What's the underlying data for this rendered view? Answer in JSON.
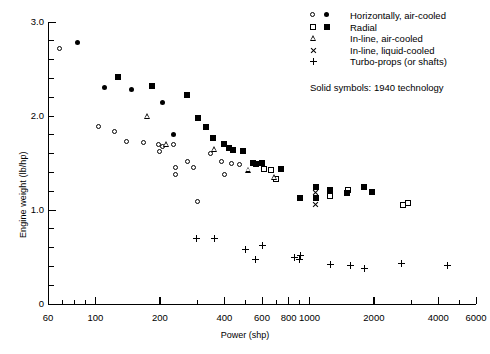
{
  "chart_data": {
    "type": "scatter",
    "title": "",
    "xlabel": "Power (shp)",
    "ylabel": "Engine weight (lb/hp)",
    "xscale": "log",
    "yscale": "linear",
    "xlim": [
      60,
      6000
    ],
    "ylim": [
      0,
      3.0
    ],
    "xticks": [
      60,
      100,
      200,
      400,
      600,
      800,
      1000,
      2000,
      4000,
      6000
    ],
    "xtick_labels": [
      "60",
      "100",
      "200",
      "400",
      "600",
      "800",
      "1000",
      "2000",
      "4000",
      "6000"
    ],
    "yticks": [
      0,
      1.0,
      2.0,
      3.0
    ],
    "ytick_labels": [
      "0",
      "1.0",
      "2.0",
      "3.0"
    ],
    "ytick_minor_step": 0.2,
    "grid": false,
    "legend_position": "top-right",
    "annotations": [
      "Solid symbols:  1940 technology"
    ],
    "series": [
      {
        "name": "Horizontally, air-cooled",
        "marker": "circle-open",
        "filled": false,
        "points": [
          [
            68,
            2.72
          ],
          [
            103,
            1.89
          ],
          [
            123,
            1.83
          ],
          [
            140,
            1.73
          ],
          [
            168,
            1.72
          ],
          [
            196,
            1.7
          ],
          [
            200,
            1.62
          ],
          [
            205,
            1.68
          ],
          [
            232,
            1.7
          ],
          [
            236,
            1.45
          ],
          [
            236,
            1.38
          ],
          [
            270,
            1.52
          ],
          [
            286,
            1.45
          ],
          [
            300,
            1.09
          ],
          [
            345,
            1.6
          ],
          [
            390,
            1.52
          ],
          [
            430,
            1.5
          ],
          [
            470,
            1.48
          ],
          [
            400,
            1.38
          ]
        ]
      },
      {
        "name": "Horizontally, air-cooled (solid)",
        "marker": "circle-filled",
        "filled": true,
        "points": [
          [
            82,
            2.78
          ],
          [
            110,
            2.3
          ],
          [
            148,
            2.28
          ],
          [
            205,
            2.14
          ],
          [
            232,
            1.8
          ]
        ]
      },
      {
        "name": "Radial",
        "marker": "square-open",
        "filled": false,
        "points": [
          [
            610,
            1.44
          ],
          [
            660,
            1.43
          ],
          [
            700,
            1.33
          ],
          [
            1250,
            1.15
          ],
          [
            1520,
            1.21
          ],
          [
            2750,
            1.05
          ],
          [
            2900,
            1.07
          ]
        ]
      },
      {
        "name": "Radial (solid)",
        "marker": "square-filled",
        "filled": true,
        "points": [
          [
            128,
            2.42
          ],
          [
            183,
            2.32
          ],
          [
            268,
            2.22
          ],
          [
            300,
            1.98
          ],
          [
            330,
            1.88
          ],
          [
            355,
            1.77
          ],
          [
            400,
            1.7
          ],
          [
            420,
            1.66
          ],
          [
            440,
            1.64
          ],
          [
            490,
            1.63
          ],
          [
            545,
            1.5
          ],
          [
            560,
            1.49
          ],
          [
            600,
            1.5
          ],
          [
            740,
            1.44
          ],
          [
            900,
            1.13
          ],
          [
            1070,
            1.24
          ],
          [
            1070,
            1.13
          ],
          [
            1250,
            1.21
          ],
          [
            1500,
            1.18
          ],
          [
            1800,
            1.25
          ],
          [
            1950,
            1.19
          ]
        ]
      },
      {
        "name": "In-line, air-cooled",
        "marker": "triangle-open",
        "filled": false,
        "points": [
          [
            175,
            2.0
          ],
          [
            215,
            1.7
          ],
          [
            360,
            1.65
          ],
          [
            520,
            1.43
          ],
          [
            690,
            1.35
          ]
        ]
      },
      {
        "name": "In-line, liquid-cooled",
        "marker": "cross",
        "filled": false,
        "points": [
          [
            1070,
            1.19
          ],
          [
            1070,
            1.06
          ]
        ]
      },
      {
        "name": "Turbo-props (or shafts)",
        "marker": "plus",
        "filled": false,
        "points": [
          [
            295,
            0.7
          ],
          [
            360,
            0.7
          ],
          [
            500,
            0.58
          ],
          [
            560,
            0.47
          ],
          [
            600,
            0.62
          ],
          [
            850,
            0.5
          ],
          [
            900,
            0.47
          ],
          [
            905,
            0.52
          ],
          [
            1250,
            0.42
          ],
          [
            1550,
            0.41
          ],
          [
            1800,
            0.38
          ],
          [
            2700,
            0.43
          ],
          [
            4400,
            0.41
          ]
        ]
      }
    ]
  },
  "axes": {
    "ylabel": "Engine weight (lb/hp)",
    "xlabel": "Power (shp)",
    "ytick_labels": [
      "3.0",
      "2.0",
      "1.0",
      "0"
    ],
    "xtick_labels": [
      "60",
      "100",
      "200",
      "400",
      "600",
      "800",
      "1000",
      "2000",
      "4000",
      "6000"
    ]
  },
  "legend": {
    "rows": [
      {
        "label": "Horizontally, air-cooled",
        "open": "circle-open",
        "solid": "circle-filled"
      },
      {
        "label": "Radial",
        "open": "square-open",
        "solid": "square-filled"
      },
      {
        "label": "In-line, air-cooled",
        "open": "triangle-open",
        "solid": ""
      },
      {
        "label": "In-line, liquid-cooled",
        "open": "cross",
        "solid": ""
      },
      {
        "label": "Turbo-props (or shafts)",
        "open": "plus",
        "solid": ""
      }
    ],
    "note": "Solid symbols:  1940 technology"
  }
}
